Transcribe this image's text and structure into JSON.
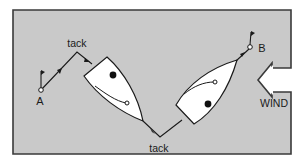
{
  "diagram": {
    "colors": {
      "background": "#c9c9c9",
      "border": "#3a3a3a",
      "line": "#1a1a1a",
      "boat_fill": "#ffffff",
      "page": "#ffffff"
    },
    "labels": {
      "start_mark": "A",
      "end_mark": "B",
      "tack_top": "tack",
      "tack_bottom": "tack",
      "wind": "WIND"
    },
    "marks": [
      {
        "id": "A",
        "x": 41,
        "y": 90,
        "icon": "flag-icon"
      },
      {
        "id": "B",
        "x": 250,
        "y": 47,
        "icon": "flag-icon"
      }
    ],
    "course_points": [
      {
        "name": "A",
        "x": 41,
        "y": 90
      },
      {
        "name": "tack",
        "x": 77,
        "y": 52
      },
      {
        "name": "tack",
        "x": 160,
        "y": 137
      },
      {
        "name": "B",
        "x": 250,
        "y": 47
      }
    ],
    "boats": [
      {
        "name": "boat-port-tack",
        "icon": "sailboat-icon"
      },
      {
        "name": "boat-starboard-tack",
        "icon": "sailboat-icon"
      }
    ],
    "wind_arrow": {
      "direction": "from right to left",
      "icon": "wind-arrow-icon"
    }
  }
}
